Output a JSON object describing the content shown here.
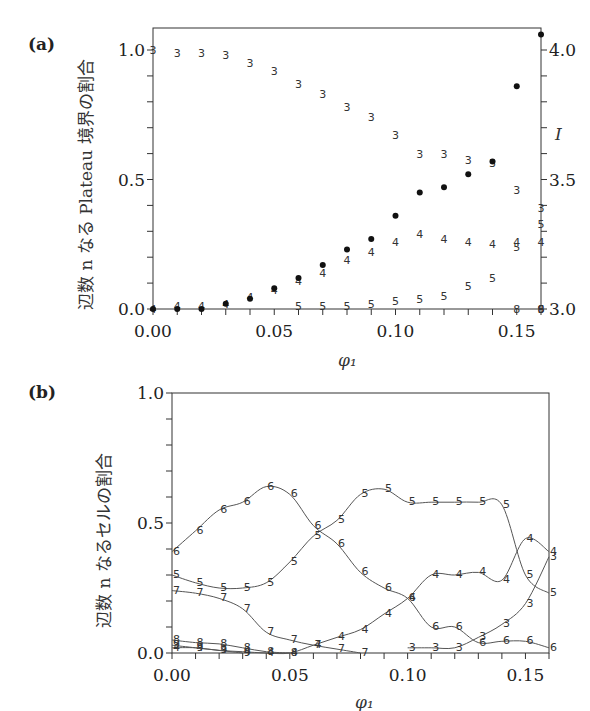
{
  "chart_data": [
    {
      "panel_label": "(a)",
      "type": "scatter",
      "xlabel": "φ₁",
      "ylabel": "辺数 n なる Plateau 境界の割合",
      "y2label": "I",
      "xlim": [
        0,
        0.16
      ],
      "ylim": [
        0,
        1.085
      ],
      "y2lim": [
        3.0,
        4.085
      ],
      "xticks": [
        "0.00",
        "0.05",
        "0.10",
        "0.15"
      ],
      "yticks": [
        "0.0",
        "0.5",
        "1.0"
      ],
      "y2ticks": [
        "3.0",
        "3.5",
        "4.0"
      ],
      "x": [
        0.0,
        0.01,
        0.02,
        0.03,
        0.04,
        0.05,
        0.06,
        0.07,
        0.08,
        0.09,
        0.1,
        0.11,
        0.12,
        0.13,
        0.14,
        0.15,
        0.16
      ],
      "series": [
        {
          "name": "3",
          "marker": "3",
          "values": [
            1.0,
            0.99,
            0.99,
            0.98,
            0.95,
            0.92,
            0.87,
            0.83,
            0.78,
            0.74,
            0.67,
            0.6,
            0.6,
            0.575,
            0.565,
            0.46,
            0.39
          ]
        },
        {
          "name": "4",
          "marker": "4",
          "values": [
            0.0,
            0.01,
            0.01,
            0.02,
            0.045,
            0.075,
            0.11,
            0.14,
            0.19,
            0.22,
            0.26,
            0.29,
            0.27,
            0.26,
            0.25,
            0.26,
            0.26
          ]
        },
        {
          "name": "5",
          "marker": "5",
          "values": [
            null,
            null,
            null,
            null,
            null,
            null,
            0.01,
            0.01,
            0.01,
            0.02,
            0.03,
            0.04,
            0.05,
            0.09,
            0.12,
            0.24,
            0.33
          ]
        },
        {
          "name": "6",
          "marker": "6",
          "values": [
            null,
            null,
            null,
            null,
            null,
            null,
            null,
            null,
            null,
            null,
            null,
            null,
            null,
            null,
            null,
            null,
            0.0
          ]
        },
        {
          "name": "8",
          "marker": "8",
          "values": [
            null,
            null,
            null,
            null,
            null,
            null,
            null,
            null,
            null,
            null,
            null,
            null,
            null,
            null,
            null,
            0.0,
            0.0
          ]
        },
        {
          "name": "9",
          "marker": "9",
          "values": [
            null,
            null,
            null,
            null,
            null,
            null,
            null,
            null,
            null,
            null,
            null,
            null,
            null,
            null,
            null,
            null,
            0.0
          ]
        },
        {
          "name": "I",
          "marker": "dot",
          "axis": "right",
          "values": [
            3.0,
            3.0,
            3.0,
            3.02,
            3.04,
            3.08,
            3.12,
            3.17,
            3.23,
            3.27,
            3.36,
            3.45,
            3.47,
            3.52,
            3.57,
            3.86,
            4.06
          ]
        }
      ]
    },
    {
      "panel_label": "(b)",
      "type": "line",
      "xlabel": "φ₁",
      "ylabel": "辺数 n なるセルの割合",
      "xlim": [
        0,
        0.16
      ],
      "ylim": [
        0,
        1.0
      ],
      "xticks": [
        "0.00",
        "0.05",
        "0.10",
        "0.15"
      ],
      "yticks": [
        "0.0",
        "0.5",
        "1.0"
      ],
      "x": [
        0.0,
        0.01,
        0.02,
        0.03,
        0.04,
        0.05,
        0.06,
        0.07,
        0.08,
        0.09,
        0.1,
        0.11,
        0.12,
        0.13,
        0.14,
        0.15,
        0.16
      ],
      "series": [
        {
          "name": "6",
          "values": [
            0.39,
            0.47,
            0.55,
            0.58,
            0.64,
            0.61,
            0.49,
            0.42,
            0.31,
            0.25,
            0.21,
            0.1,
            0.1,
            0.04,
            0.045,
            0.045,
            0.02
          ]
        },
        {
          "name": "5",
          "values": [
            0.3,
            0.27,
            0.25,
            0.25,
            0.27,
            0.35,
            0.45,
            0.51,
            0.61,
            0.63,
            0.58,
            0.58,
            0.58,
            0.58,
            0.57,
            0.3,
            0.23
          ]
        },
        {
          "name": "7",
          "values": [
            0.24,
            0.23,
            0.21,
            0.17,
            0.08,
            0.05,
            0.03,
            0.015,
            0.0,
            null,
            null,
            null,
            null,
            null,
            null,
            null,
            null
          ]
        },
        {
          "name": "4",
          "values": [
            0.02,
            0.02,
            0.01,
            0.005,
            0.0,
            0.0,
            0.03,
            0.06,
            0.09,
            0.15,
            0.21,
            0.3,
            0.3,
            0.31,
            0.28,
            0.44,
            0.39
          ]
        },
        {
          "name": "3",
          "values": [
            null,
            null,
            null,
            null,
            null,
            null,
            null,
            null,
            null,
            null,
            0.02,
            0.02,
            0.02,
            0.06,
            0.11,
            0.19,
            0.37
          ]
        },
        {
          "name": "8",
          "values": [
            0.05,
            0.04,
            0.035,
            0.02,
            0.005,
            0.0,
            null,
            null,
            null,
            null,
            null,
            null,
            null,
            null,
            null,
            null,
            null
          ]
        },
        {
          "name": "9",
          "values": [
            0.03,
            0.02,
            0.01,
            0.0,
            null,
            null,
            null,
            null,
            null,
            null,
            null,
            null,
            null,
            null,
            null,
            null,
            null
          ]
        }
      ]
    }
  ]
}
